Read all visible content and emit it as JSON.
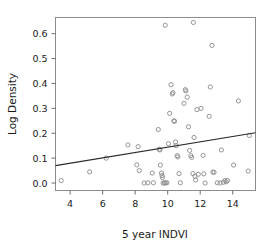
{
  "chart_data": {
    "type": "scatter",
    "title": "",
    "xlabel": "5 year INDVI",
    "ylabel": "Log Density",
    "xlim": [
      3.1,
      15.4
    ],
    "ylim": [
      -0.03,
      0.665
    ],
    "grid": false,
    "legend": null,
    "xticks": [
      4,
      6,
      8,
      10,
      12,
      14
    ],
    "xtick_labels": [
      "4",
      "6",
      "8",
      "10",
      "12",
      "14"
    ],
    "yticks": [
      0.0,
      0.1,
      0.2,
      0.3,
      0.4,
      0.5,
      0.6
    ],
    "ytick_labels": [
      "0.0",
      "0.1",
      "0.2",
      "0.3",
      "0.4",
      "0.5",
      "0.6"
    ],
    "marker": "open-circle",
    "marker_color": "#8a8a8a",
    "points": [
      [
        3.45,
        0.01
      ],
      [
        5.2,
        0.045
      ],
      [
        6.22,
        0.1
      ],
      [
        7.55,
        0.153
      ],
      [
        8.1,
        0.073
      ],
      [
        8.18,
        0.146
      ],
      [
        8.25,
        0.05
      ],
      [
        8.55,
        0.0
      ],
      [
        8.78,
        0.001
      ],
      [
        9.05,
        0.04
      ],
      [
        9.12,
        0.001
      ],
      [
        9.42,
        0.215
      ],
      [
        9.48,
        0.136
      ],
      [
        9.52,
        0.133
      ],
      [
        9.55,
        0.072
      ],
      [
        9.62,
        0.04
      ],
      [
        9.65,
        0.03
      ],
      [
        9.68,
        0.022
      ],
      [
        9.72,
        0.0
      ],
      [
        9.8,
        0.0
      ],
      [
        9.85,
        0.634
      ],
      [
        9.88,
        0.001
      ],
      [
        9.95,
        0.001
      ],
      [
        10.05,
        0.158
      ],
      [
        10.12,
        0.28
      ],
      [
        10.2,
        0.395
      ],
      [
        10.28,
        0.358
      ],
      [
        10.32,
        0.363
      ],
      [
        10.38,
        0.25
      ],
      [
        10.42,
        0.248
      ],
      [
        10.48,
        0.165
      ],
      [
        10.52,
        0.15
      ],
      [
        10.58,
        0.11
      ],
      [
        10.62,
        0.105
      ],
      [
        10.7,
        0.038
      ],
      [
        10.78,
        0.001
      ],
      [
        11.0,
        0.32
      ],
      [
        11.08,
        0.375
      ],
      [
        11.12,
        0.37
      ],
      [
        11.2,
        0.345
      ],
      [
        11.28,
        0.226
      ],
      [
        11.35,
        0.131
      ],
      [
        11.42,
        0.11
      ],
      [
        11.48,
        0.103
      ],
      [
        11.55,
        0.038
      ],
      [
        11.58,
        0.645
      ],
      [
        11.62,
        0.183
      ],
      [
        11.68,
        0.027
      ],
      [
        11.72,
        0.012
      ],
      [
        11.8,
        0.295
      ],
      [
        11.88,
        0.035
      ],
      [
        12.05,
        0.3
      ],
      [
        12.18,
        0.111
      ],
      [
        12.22,
        0.037
      ],
      [
        12.3,
        0.0
      ],
      [
        12.55,
        0.268
      ],
      [
        12.62,
        0.386
      ],
      [
        12.72,
        0.553
      ],
      [
        12.78,
        0.044
      ],
      [
        12.85,
        0.043
      ],
      [
        13.05,
        0.001
      ],
      [
        13.22,
        0.0
      ],
      [
        13.3,
        0.133
      ],
      [
        13.42,
        0.003
      ],
      [
        13.52,
        0.01
      ],
      [
        13.6,
        0.005
      ],
      [
        13.68,
        0.01
      ],
      [
        14.05,
        0.072
      ],
      [
        14.35,
        0.33
      ],
      [
        14.95,
        0.048
      ],
      [
        15.02,
        0.191
      ]
    ],
    "trend_line": {
      "x_start": 3.1,
      "y_start": 0.07,
      "x_end": 15.4,
      "y_end": 0.202,
      "color": "#2b2b2b"
    }
  },
  "axes": {
    "x_axis_title": "5 year INDVI",
    "y_axis_title": "Log Density"
  }
}
